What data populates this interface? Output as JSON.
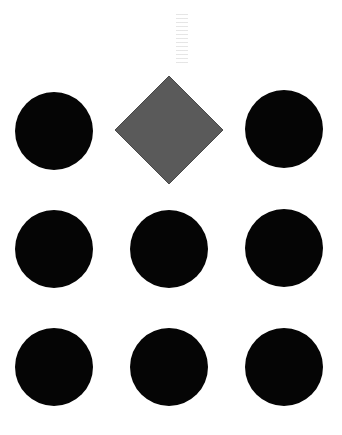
{
  "canvas": {
    "width": 342,
    "height": 435,
    "background": "#ffffff"
  },
  "colors": {
    "circle": "#050505",
    "diamond": "#5a5a5a",
    "diamond_edge": "#4a4a4a"
  },
  "grid": {
    "rows": 3,
    "cols": 3,
    "cells": [
      {
        "row": 0,
        "col": 0,
        "shape": "circle",
        "cx": 54,
        "cy": 131,
        "r": 39
      },
      {
        "row": 0,
        "col": 1,
        "shape": "diamond",
        "cx": 169,
        "cy": 130,
        "half": 55
      },
      {
        "row": 0,
        "col": 2,
        "shape": "circle",
        "cx": 284,
        "cy": 129,
        "r": 39
      },
      {
        "row": 1,
        "col": 0,
        "shape": "circle",
        "cx": 54,
        "cy": 249,
        "r": 39
      },
      {
        "row": 1,
        "col": 1,
        "shape": "circle",
        "cx": 169,
        "cy": 249,
        "r": 39
      },
      {
        "row": 1,
        "col": 2,
        "shape": "circle",
        "cx": 284,
        "cy": 248,
        "r": 39
      },
      {
        "row": 2,
        "col": 0,
        "shape": "circle",
        "cx": 54,
        "cy": 367,
        "r": 39
      },
      {
        "row": 2,
        "col": 1,
        "shape": "circle",
        "cx": 169,
        "cy": 367,
        "r": 39
      },
      {
        "row": 2,
        "col": 2,
        "shape": "circle",
        "cx": 284,
        "cy": 367,
        "r": 39
      }
    ]
  }
}
